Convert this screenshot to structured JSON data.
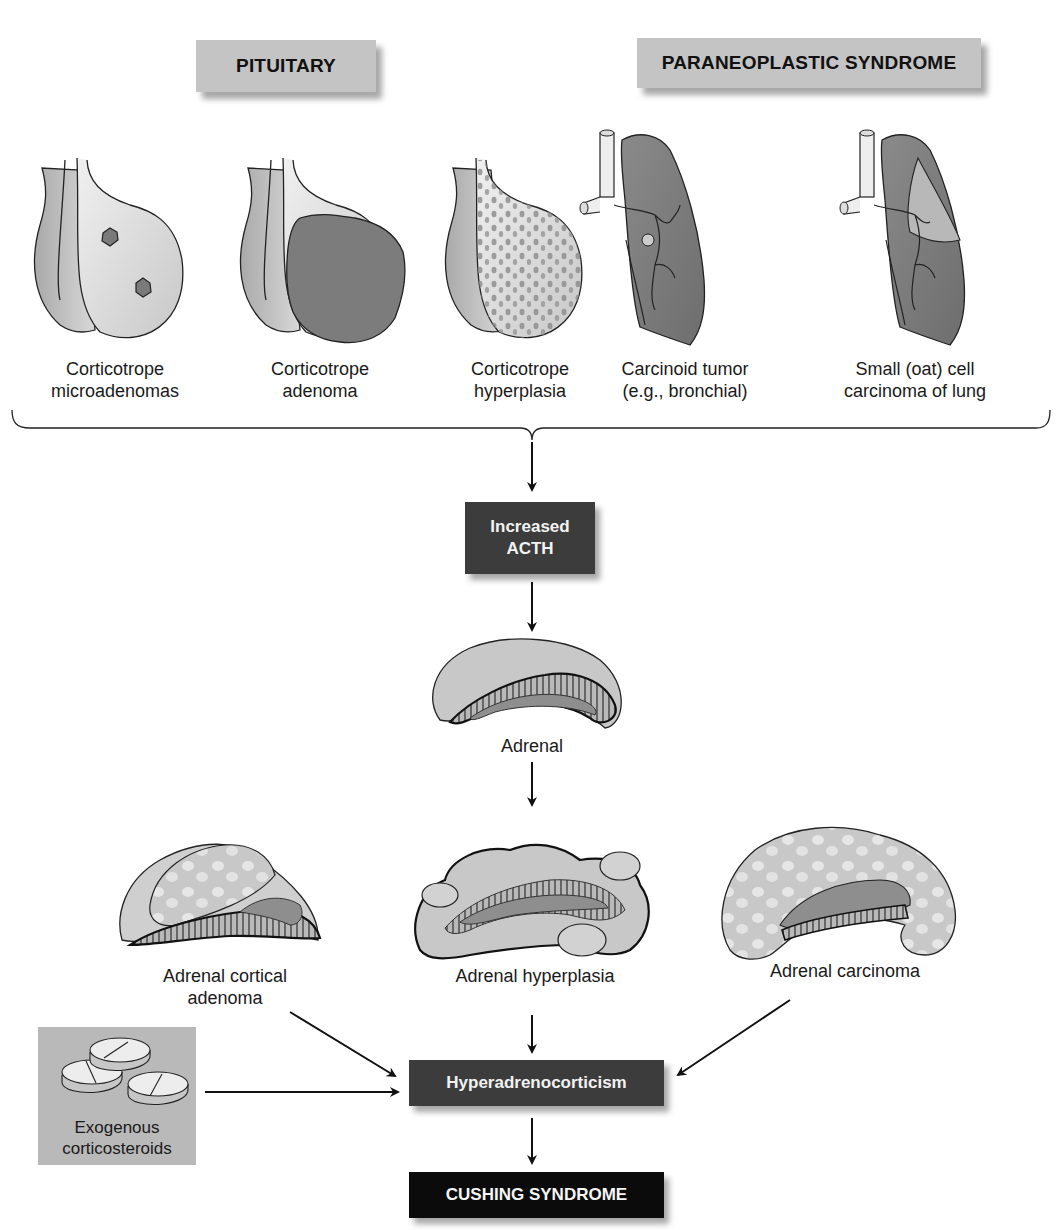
{
  "headers": {
    "pituitary": "PITUITARY",
    "paraneoplastic": "PARANEOPLASTIC SYNDROME"
  },
  "causes": [
    {
      "line1": "Corticotrope",
      "line2": "microadenomas",
      "group": "pituitary"
    },
    {
      "line1": "Corticotrope",
      "line2": "adenoma",
      "group": "pituitary"
    },
    {
      "line1": "Corticotrope",
      "line2": "hyperplasia",
      "group": "pituitary"
    },
    {
      "line1": "Carcinoid tumor",
      "line2": "(e.g., bronchial)",
      "group": "paraneoplastic"
    },
    {
      "line1": "Small (oat) cell",
      "line2": "carcinoma of lung",
      "group": "paraneoplastic"
    }
  ],
  "acth_box": {
    "line1": "Increased",
    "line2": "ACTH"
  },
  "adrenal_label": "Adrenal",
  "adrenal_pathologies": [
    {
      "line1": "Adrenal cortical",
      "line2": "adenoma"
    },
    {
      "line1": "Adrenal hyperplasia",
      "line2": ""
    },
    {
      "line1": "Adrenal carcinoma",
      "line2": ""
    }
  ],
  "exogenous": {
    "line1": "Exogenous",
    "line2": "corticosteroids"
  },
  "hyper_box": "Hyperadrenocorticism",
  "outcome_box": "CUSHING SYNDROME",
  "colors": {
    "header_bg": "#c4c4c4",
    "dark_box_bg": "#3c3c3c",
    "outcome_bg": "#0b0b0b",
    "tissue_light": "#d6d6d6",
    "tissue_mid": "#a8a8a8",
    "tissue_dark": "#7c7c7c"
  }
}
